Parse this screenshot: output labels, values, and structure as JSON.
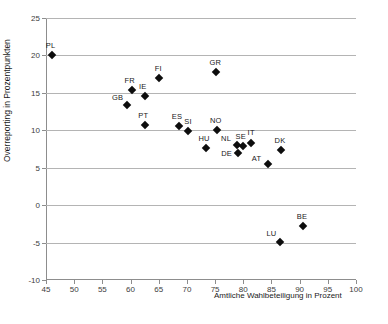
{
  "chart_data": {
    "type": "scatter",
    "title": "",
    "xlabel": "Amtliche Wahlbeteiligung in Prozent",
    "ylabel": "Overreporting in Prozentpunkten",
    "xlim": [
      45,
      100
    ],
    "ylim": [
      -10,
      25
    ],
    "xticks": [
      45,
      50,
      55,
      60,
      65,
      70,
      75,
      80,
      85,
      90,
      95,
      100
    ],
    "yticks": [
      -10,
      -5,
      0,
      5,
      10,
      15,
      20,
      25
    ],
    "grid": "horizontal",
    "legend": "none",
    "marker": "diamond",
    "marker_color": "#0d0d0d",
    "points": [
      {
        "label": "PL",
        "x": 46.0,
        "y": 20.0,
        "label_dx": -1,
        "label_dy": -10
      },
      {
        "label": "GR",
        "x": 75.2,
        "y": 17.8,
        "label_dx": -1,
        "label_dy": -10
      },
      {
        "label": "FI",
        "x": 65.1,
        "y": 17.0,
        "label_dx": -1,
        "label_dy": -10
      },
      {
        "label": "FR",
        "x": 60.2,
        "y": 15.4,
        "label_dx": -2,
        "label_dy": -10
      },
      {
        "label": "IE",
        "x": 62.5,
        "y": 14.6,
        "label_dx": -2,
        "label_dy": -10
      },
      {
        "label": "GB",
        "x": 59.3,
        "y": 13.4,
        "label_dx": -9,
        "label_dy": -8
      },
      {
        "label": "PT",
        "x": 62.6,
        "y": 10.7,
        "label_dx": -2,
        "label_dy": -10
      },
      {
        "label": "ES",
        "x": 68.6,
        "y": 10.6,
        "label_dx": -2,
        "label_dy": -10
      },
      {
        "label": "SI",
        "x": 70.2,
        "y": 9.9,
        "label_dx": 0,
        "label_dy": -10
      },
      {
        "label": "NO",
        "x": 75.3,
        "y": 10.1,
        "label_dx": -1,
        "label_dy": -10
      },
      {
        "label": "HU",
        "x": 73.4,
        "y": 7.6,
        "label_dx": -2,
        "label_dy": -10
      },
      {
        "label": "NL",
        "x": 78.9,
        "y": 8.1,
        "label_dx": -11,
        "label_dy": -7
      },
      {
        "label": "DE",
        "x": 79.0,
        "y": 7.0,
        "label_dx": -11,
        "label_dy": 0
      },
      {
        "label": "SE",
        "x": 79.9,
        "y": 7.9,
        "label_dx": -2,
        "label_dy": -10
      },
      {
        "label": "IT",
        "x": 81.4,
        "y": 8.3,
        "label_dx": 0,
        "label_dy": -11
      },
      {
        "label": "DK",
        "x": 86.7,
        "y": 7.4,
        "label_dx": -1,
        "label_dy": -10
      },
      {
        "label": "AT",
        "x": 84.3,
        "y": 5.5,
        "label_dx": -11,
        "label_dy": -6
      },
      {
        "label": "BE",
        "x": 90.6,
        "y": -2.8,
        "label_dx": -1,
        "label_dy": -10
      },
      {
        "label": "LU",
        "x": 86.6,
        "y": -4.9,
        "label_dx": -9,
        "label_dy": -9
      }
    ]
  }
}
